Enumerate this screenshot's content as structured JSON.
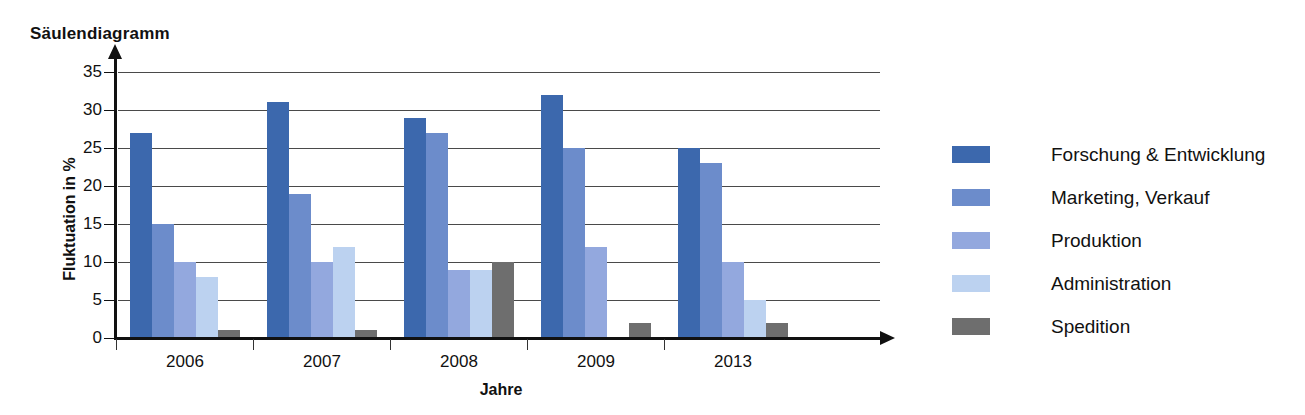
{
  "chart_data": {
    "type": "bar",
    "title": "Säulendiagramm",
    "xlabel": "Jahre",
    "ylabel": "Fluktuation in %",
    "categories": [
      "2006",
      "2007",
      "2008",
      "2009",
      "2013"
    ],
    "ytick_labels": [
      "0",
      "5",
      "10",
      "15",
      "20",
      "25",
      "30",
      "35"
    ],
    "ylim": [
      0,
      35
    ],
    "grid": true,
    "legend_position": "right",
    "series": [
      {
        "name": "Forschung & Entwicklung",
        "color": "#3c68ad",
        "values": [
          27,
          31,
          29,
          32,
          25
        ]
      },
      {
        "name": "Marketing, Verkauf",
        "color": "#6c8ccb",
        "values": [
          15,
          19,
          27,
          25,
          23
        ]
      },
      {
        "name": "Produktion",
        "color": "#93a8de",
        "values": [
          10,
          10,
          9,
          12,
          10
        ]
      },
      {
        "name": "Administration",
        "color": "#bcd2f0",
        "values": [
          8,
          12,
          9,
          0,
          5
        ]
      },
      {
        "name": "Spedition",
        "color": "#6e6e6e",
        "values": [
          1,
          1,
          10,
          2,
          2
        ]
      }
    ]
  }
}
